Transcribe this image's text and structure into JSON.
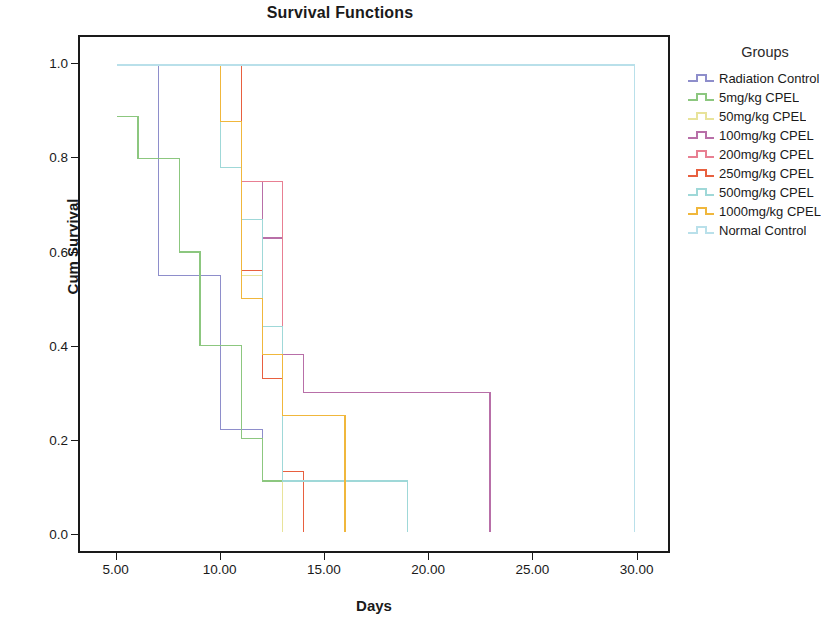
{
  "chart_data": {
    "type": "line",
    "title": "Survival Functions",
    "xlabel": "Days",
    "ylabel": "Cum Survival",
    "xlim": [
      3.2,
      31.6
    ],
    "ylim": [
      -0.04,
      1.06
    ],
    "x_ticks": [
      "5.00",
      "10.00",
      "15.00",
      "20.00",
      "25.00",
      "30.00"
    ],
    "x_tick_values": [
      5,
      10,
      15,
      20,
      25,
      30
    ],
    "y_ticks": [
      "0.0",
      "0.2",
      "0.4",
      "0.6",
      "0.8",
      "1.0"
    ],
    "y_tick_values": [
      0.0,
      0.2,
      0.4,
      0.6,
      0.8,
      1.0
    ],
    "grid": false,
    "legend_position": "right",
    "legend_title": "Groups",
    "step_style": "post",
    "series": [
      {
        "name": "Radiation Control",
        "color": "#8e8ecb",
        "x": [
          5,
          7,
          7,
          8,
          9,
          10,
          11,
          12,
          13,
          19
        ],
        "y": [
          1.0,
          1.0,
          0.55,
          0.55,
          0.55,
          0.22,
          0.22,
          0.11,
          0.11,
          0.11
        ]
      },
      {
        "name": "5mg/kg CPEL",
        "color": "#8cc77f",
        "x": [
          5,
          6,
          7,
          8,
          9,
          10,
          11,
          12,
          13
        ],
        "y": [
          0.89,
          0.8,
          0.8,
          0.6,
          0.4,
          0.4,
          0.2,
          0.11,
          0.11
        ]
      },
      {
        "name": "50mg/kg CPEL",
        "color": "#e8e39a",
        "x": [
          5,
          9,
          10,
          11,
          12,
          13
        ],
        "y": [
          1.0,
          1.0,
          0.78,
          0.55,
          0.44,
          0.11
        ]
      },
      {
        "name": "100mg/kg CPEL",
        "color": "#b86fa8",
        "x": [
          5,
          10,
          11,
          12,
          13,
          14,
          16,
          23
        ],
        "y": [
          1.0,
          1.0,
          0.75,
          0.63,
          0.38,
          0.3,
          0.3,
          0.1
        ]
      },
      {
        "name": "200mg/kg CPEL",
        "color": "#e87f92",
        "x": [
          5,
          9,
          10,
          11,
          12,
          13,
          14
        ],
        "y": [
          1.0,
          1.0,
          0.88,
          0.75,
          0.75,
          0.13,
          0.13
        ]
      },
      {
        "name": "250mg/kg CPEL",
        "color": "#e8603f",
        "x": [
          5,
          10,
          11,
          12,
          13,
          14
        ],
        "y": [
          1.0,
          1.0,
          0.56,
          0.33,
          0.13,
          0.0
        ]
      },
      {
        "name": "500mg/kg CPEL",
        "color": "#9fd8d8",
        "x": [
          5,
          9,
          10,
          11,
          12,
          13,
          19
        ],
        "y": [
          1.0,
          1.0,
          0.78,
          0.67,
          0.44,
          0.11,
          0.11
        ]
      },
      {
        "name": "1000mg/kg CPEL",
        "color": "#f0b73c",
        "x": [
          5,
          9,
          10,
          11,
          12,
          13,
          16
        ],
        "y": [
          1.0,
          1.0,
          0.88,
          0.5,
          0.38,
          0.25,
          0.0
        ]
      },
      {
        "name": "Normal Control",
        "color": "#b9e0ea",
        "x": [
          5,
          30
        ],
        "y": [
          1.0,
          1.0
        ]
      }
    ]
  }
}
